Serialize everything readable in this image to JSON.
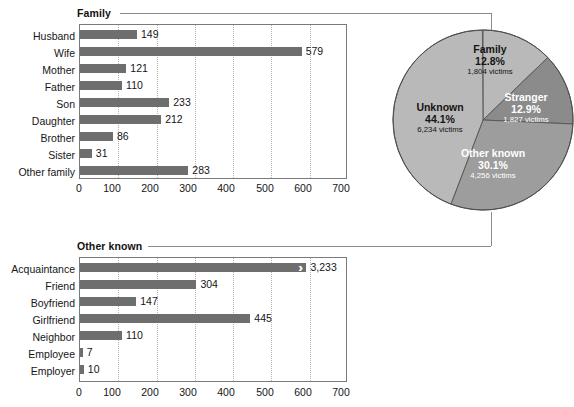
{
  "chart_data": [
    {
      "type": "bar",
      "title": "Family",
      "orientation": "horizontal",
      "categories": [
        "Husband",
        "Wife",
        "Mother",
        "Father",
        "Son",
        "Daughter",
        "Brother",
        "Sister",
        "Other family"
      ],
      "values": [
        149,
        579,
        121,
        110,
        233,
        212,
        86,
        31,
        283
      ],
      "value_labels": [
        "149",
        "579",
        "121",
        "110",
        "233",
        "212",
        "86",
        "31",
        "283"
      ],
      "xlabel": "",
      "ylabel": "",
      "xlim": [
        0,
        700
      ],
      "xticks": [
        0,
        100,
        200,
        300,
        400,
        500,
        600,
        700
      ],
      "xtick_labels": [
        "0",
        "100",
        "200",
        "300",
        "400",
        "500",
        "600",
        "700"
      ],
      "grid": true,
      "bar_color": "#6e6e6e"
    },
    {
      "type": "pie",
      "title": "",
      "slices": [
        {
          "name": "Family",
          "percent": 12.8,
          "percent_label": "12.8%",
          "victims": 1804,
          "victims_label": "1,804 victims",
          "color": "#b9b9b9",
          "text_color": "#141414"
        },
        {
          "name": "Stranger",
          "percent": 12.9,
          "percent_label": "12.9%",
          "victims": 1827,
          "victims_label": "1,827 victims",
          "color": "#8b8b8b",
          "text_color": "#ffffff"
        },
        {
          "name": "Other known",
          "percent": 30.1,
          "percent_label": "30.1%",
          "victims": 4256,
          "victims_label": "4,256 victims",
          "color": "#9d9d9d",
          "text_color": "#ffffff"
        },
        {
          "name": "Unknown",
          "percent": 44.1,
          "percent_label": "44.1%",
          "victims": 6234,
          "victims_label": "6,234 victims",
          "color": "#b9b9b9",
          "text_color": "#141414"
        }
      ],
      "legend_position": "inside-slices",
      "start_angle_deg": 0,
      "direction": "clockwise"
    },
    {
      "type": "bar",
      "title": "Other known",
      "orientation": "horizontal",
      "categories": [
        "Acquaintance",
        "Friend",
        "Boyfriend",
        "Girlfriend",
        "Neighbor",
        "Employee",
        "Employer"
      ],
      "values": [
        3233,
        304,
        147,
        445,
        110,
        7,
        10
      ],
      "value_labels": [
        "3,233",
        "304",
        "147",
        "445",
        "110",
        "7",
        "10"
      ],
      "axis_broken_bars": [
        "Acquaintance"
      ],
      "break_marker": "›",
      "xlabel": "",
      "ylabel": "",
      "xlim": [
        0,
        700
      ],
      "xticks": [
        0,
        100,
        200,
        300,
        400,
        500,
        600,
        700
      ],
      "xtick_labels": [
        "0",
        "100",
        "200",
        "300",
        "400",
        "500",
        "600",
        "700"
      ],
      "grid": true,
      "bar_color": "#6e6e6e"
    }
  ]
}
